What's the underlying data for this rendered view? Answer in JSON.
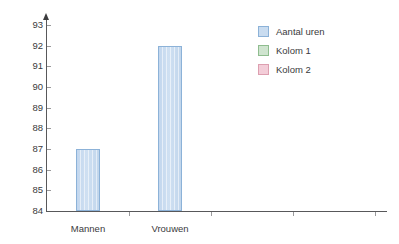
{
  "chart_data": {
    "type": "bar",
    "title": "",
    "subtitle": "",
    "xlabel": "",
    "ylabel": "",
    "categories": [
      "Mannen",
      "Vrouwen"
    ],
    "series": [
      {
        "name": "Aantal uren",
        "values": [
          87,
          92
        ]
      }
    ],
    "ylim": [
      84,
      93
    ],
    "ytick_labels": [
      "93",
      "92",
      "91",
      "90",
      "89",
      "88",
      "87",
      "86",
      "85",
      "84"
    ],
    "ytick_values": [
      93,
      92,
      91,
      90,
      89,
      88,
      87,
      86,
      85,
      84
    ],
    "grid": false,
    "legend_position": "top-right",
    "annotations": []
  },
  "legend": {
    "entries": [
      {
        "label": "Aantal uren",
        "fill": "#c9dcf0",
        "border": "#8cb2d8"
      },
      {
        "label": "Kolom 1",
        "fill": "#cfe4cf",
        "border": "#8fbd8f"
      },
      {
        "label": "Kolom 2",
        "fill": "#f3cdd8",
        "border": "#dd9fb0"
      }
    ]
  },
  "axis": {
    "line_color": "#58585a",
    "tick_color": "#9a9a9c",
    "label_color": "#3a3a3c"
  },
  "bars": {
    "fill": "#c9dcf0",
    "border": "#8cb2d8"
  }
}
